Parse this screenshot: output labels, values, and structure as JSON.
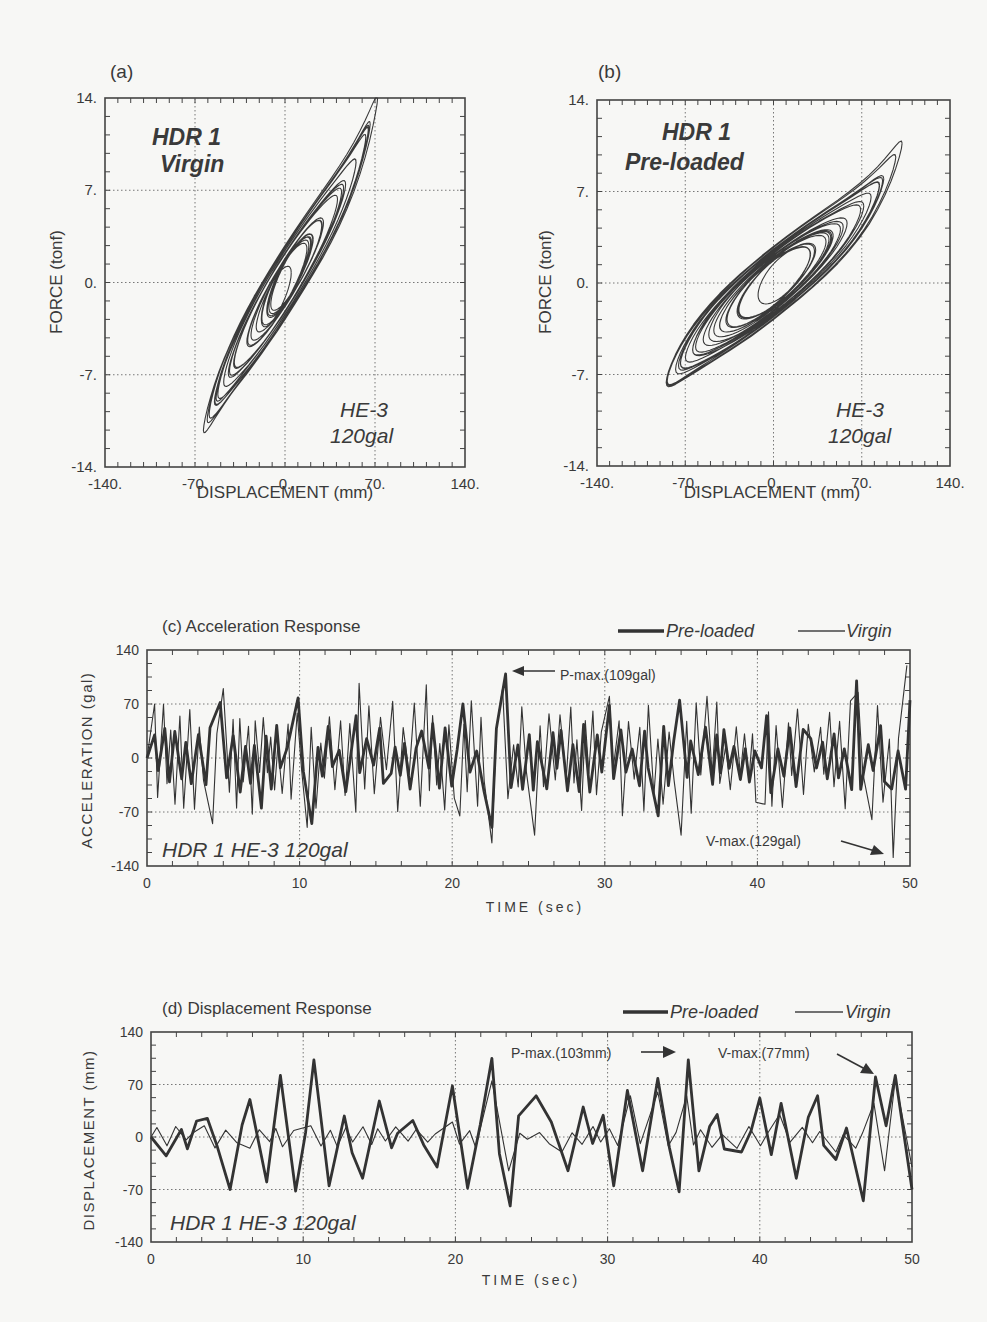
{
  "chart_data": [
    {
      "id": "a",
      "panel_label": "(a)",
      "type": "line",
      "title": "HDR 1 Virgin",
      "title_lines": [
        "HDR 1",
        "Virgin"
      ],
      "annotation_lines": [
        "HE-3",
        "120gal"
      ],
      "xlabel": "DISPLACEMENT  (mm)",
      "ylabel": "FORCE  (tonf)",
      "xlim": [
        -140,
        140
      ],
      "ylim": [
        -14,
        14
      ],
      "xticks": [
        "-140.",
        "-70.",
        "0.",
        "70.",
        "140."
      ],
      "yticks": [
        "14.",
        "7.",
        "0.",
        "-7.",
        "-14."
      ],
      "grid": true,
      "description": "Force-displacement hysteresis loops, steep slope; loops span about -72 to +72 mm displacement and -12 to +14 tonf force",
      "loop_envelope": {
        "x_min": -72,
        "x_max": 72,
        "y_min": -12.2,
        "y_max": 14.0
      },
      "series": [
        {
          "name": "Virgin hysteresis",
          "slope_tonf_per_mm": 0.15
        }
      ]
    },
    {
      "id": "b",
      "panel_label": "(b)",
      "type": "line",
      "title": "HDR 1 Pre-loaded",
      "title_lines": [
        "HDR 1",
        "Pre-loaded"
      ],
      "annotation_lines": [
        "HE-3",
        "120gal"
      ],
      "xlabel": "DISPLACEMENT  (mm)",
      "ylabel": "FORCE  (tonf)",
      "xlim": [
        -140,
        140
      ],
      "ylim": [
        -14,
        14
      ],
      "xticks": [
        "-140.",
        "-70.",
        "0.",
        "70.",
        "140."
      ],
      "yticks": [
        "14.",
        "7.",
        "0.",
        "-7.",
        "-14."
      ],
      "grid": true,
      "description": "Force-displacement hysteresis loops, shallower slope; loops span about -103 to +102 mm and -12 to +11 tonf",
      "loop_envelope": {
        "x_min": -103,
        "x_max": 102,
        "y_min": -12.0,
        "y_max": 11.0
      },
      "series": [
        {
          "name": "Pre-loaded hysteresis",
          "slope_tonf_per_mm": 0.075
        }
      ]
    },
    {
      "id": "c",
      "panel_label": "(c) Acceleration Response",
      "type": "line",
      "title": "(c) Acceleration Response",
      "xlabel": "TIME  (sec)",
      "ylabel": "ACCELERATION  (gal)",
      "xlim": [
        0,
        50
      ],
      "ylim": [
        -140,
        140
      ],
      "xticks": [
        "0",
        "10",
        "20",
        "30",
        "40",
        "50"
      ],
      "yticks": [
        "140",
        "70",
        "0",
        "-70",
        "-140"
      ],
      "grid": true,
      "legend": [
        {
          "name": "Pre-loaded",
          "style": "thick"
        },
        {
          "name": "Virgin",
          "style": "thin"
        }
      ],
      "legend_position": "top-right",
      "inner_label": "HDR 1  HE-3  120gal",
      "annotations": [
        {
          "text": "P-max.(109gal)",
          "x": 23.5,
          "y": 109
        },
        {
          "text": "V-max.(129gal)",
          "x": 48.9,
          "y": -129
        }
      ],
      "series": [
        {
          "name": "Pre-loaded",
          "peaks": [
            [
              0.5,
              30
            ],
            [
              4.8,
              72
            ],
            [
              7.5,
              -65
            ],
            [
              9.9,
              78
            ],
            [
              10.8,
              -85
            ],
            [
              13.7,
              55
            ],
            [
              16.0,
              -20
            ],
            [
              18.0,
              35
            ],
            [
              20.7,
              70
            ],
            [
              22.6,
              -90
            ],
            [
              23.5,
              109
            ],
            [
              26.2,
              -40
            ],
            [
              30.3,
              68
            ],
            [
              33.5,
              -75
            ],
            [
              34.9,
              75
            ],
            [
              36.6,
              40
            ],
            [
              40.6,
              55
            ],
            [
              43.5,
              25
            ],
            [
              46.5,
              100
            ],
            [
              48.8,
              -40
            ],
            [
              50,
              75
            ]
          ]
        },
        {
          "name": "Virgin",
          "peaks": [
            [
              0.5,
              70
            ],
            [
              4.3,
              -85
            ],
            [
              5.0,
              90
            ],
            [
              10.5,
              -90
            ],
            [
              13.9,
              97
            ],
            [
              18.3,
              95
            ],
            [
              20.5,
              -75
            ],
            [
              22.6,
              -110
            ],
            [
              23.3,
              90
            ],
            [
              25.4,
              -100
            ],
            [
              30.3,
              80
            ],
            [
              35.0,
              -100
            ],
            [
              36.7,
              80
            ],
            [
              40.5,
              -60
            ],
            [
              46.6,
              85
            ],
            [
              47.5,
              -80
            ],
            [
              48.9,
              -129
            ],
            [
              49.8,
              120
            ]
          ]
        }
      ]
    },
    {
      "id": "d",
      "panel_label": "(d) Displacement Response",
      "type": "line",
      "title": "(d) Displacement Response",
      "xlabel": "TIME  (sec)",
      "ylabel": "DISPLACEMENT  (mm)",
      "xlim": [
        0,
        50
      ],
      "ylim": [
        -140,
        140
      ],
      "xticks": [
        "0",
        "10",
        "20",
        "30",
        "40",
        "50"
      ],
      "yticks": [
        "140",
        "70",
        "0",
        "-70",
        "-140"
      ],
      "grid": true,
      "legend": [
        {
          "name": "Pre-loaded",
          "style": "thick"
        },
        {
          "name": "Virgin",
          "style": "thin"
        }
      ],
      "legend_position": "top-right",
      "inner_label": "HDR 1  HE-3  120gal",
      "annotations": [
        {
          "text": "P-max.(103mm)",
          "x": 35.3,
          "y": 103
        },
        {
          "text": "V-max.(77mm)",
          "x": 48.5,
          "y": 77
        }
      ],
      "series": [
        {
          "name": "Pre-loaded",
          "peaks": [
            [
              0,
              -5
            ],
            [
              1.0,
              -25
            ],
            [
              2.0,
              10
            ],
            [
              3.7,
              25
            ],
            [
              5.2,
              -70
            ],
            [
              6.5,
              50
            ],
            [
              7.6,
              -60
            ],
            [
              8.5,
              82
            ],
            [
              9.5,
              -72
            ],
            [
              10.7,
              103
            ],
            [
              11.7,
              -65
            ],
            [
              12.7,
              28
            ],
            [
              13.9,
              -55
            ],
            [
              15.0,
              48
            ],
            [
              16.2,
              5
            ],
            [
              17.2,
              22
            ],
            [
              18.8,
              -40
            ],
            [
              19.8,
              68
            ],
            [
              20.8,
              -68
            ],
            [
              22.4,
              105
            ],
            [
              23.6,
              -92
            ],
            [
              25.3,
              55
            ],
            [
              26.3,
              20
            ],
            [
              27.4,
              -45
            ],
            [
              28.4,
              40
            ],
            [
              30.4,
              -65
            ],
            [
              31.3,
              62
            ],
            [
              32.3,
              -45
            ],
            [
              33.3,
              78
            ],
            [
              34.7,
              -73
            ],
            [
              35.3,
              103
            ],
            [
              36.0,
              -45
            ],
            [
              37.2,
              30
            ],
            [
              38.8,
              -20
            ],
            [
              40.0,
              52
            ],
            [
              41.4,
              45
            ],
            [
              42.4,
              -55
            ],
            [
              43.8,
              55
            ],
            [
              45.0,
              -30
            ],
            [
              46.8,
              -85
            ],
            [
              47.6,
              80
            ],
            [
              48.3,
              15
            ],
            [
              48.9,
              82
            ],
            [
              50,
              -70
            ]
          ]
        },
        {
          "name": "Virgin",
          "peaks": [
            [
              3.5,
              15
            ],
            [
              6.5,
              -15
            ],
            [
              10.5,
              15
            ],
            [
              14.5,
              -10
            ],
            [
              19.8,
              20
            ],
            [
              22.4,
              75
            ],
            [
              23.5,
              -45
            ],
            [
              27.0,
              -20
            ],
            [
              31.5,
              55
            ],
            [
              33.3,
              60
            ],
            [
              35.2,
              55
            ],
            [
              38.5,
              -15
            ],
            [
              41.3,
              30
            ],
            [
              45.0,
              -20
            ],
            [
              47.5,
              45
            ],
            [
              48.2,
              -45
            ],
            [
              48.9,
              77
            ],
            [
              50,
              -40
            ]
          ]
        }
      ]
    }
  ]
}
